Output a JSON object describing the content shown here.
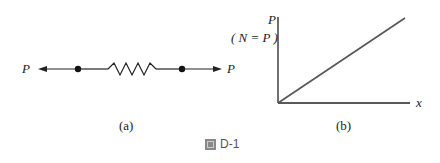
{
  "figure": {
    "caption": "D-1",
    "caption_icon": "figure-icon"
  },
  "panel_a": {
    "label": "(a)",
    "left_force": "P",
    "right_force": "P"
  },
  "panel_b": {
    "label": "(b)",
    "y_axis_label": "P",
    "y_axis_note": "( N = P )",
    "x_axis_label": "x"
  },
  "colors": {
    "line": "#222222",
    "plot_line": "#555555"
  }
}
